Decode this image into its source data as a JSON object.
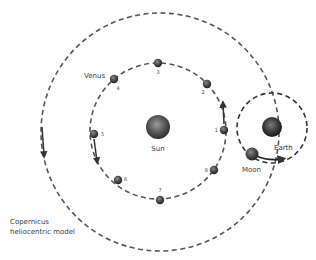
{
  "title": "Copernicus heliocentric model",
  "caption": {
    "line1": "Copernicus",
    "line2": "heliocentric model"
  },
  "labels": {
    "sun": "Sun",
    "venus": "Venus",
    "earth": "Earth",
    "moon": "Moon"
  },
  "venus_positions": [
    {
      "n": "1",
      "x": 224,
      "y": 130
    },
    {
      "n": "2",
      "x": 207,
      "y": 84
    },
    {
      "n": "3",
      "x": 158,
      "y": 63
    },
    {
      "n": "4",
      "x": 114,
      "y": 79
    },
    {
      "n": "5",
      "x": 94,
      "y": 134
    },
    {
      "n": "6",
      "x": 118,
      "y": 180
    },
    {
      "n": "7",
      "x": 160,
      "y": 200
    },
    {
      "n": "8",
      "x": 214,
      "y": 170
    }
  ],
  "orbits": {
    "earth_orbit": {
      "cx": 160,
      "cy": 132,
      "r": 119
    },
    "venus_orbit": {
      "cx": 158,
      "cy": 131,
      "r": 68
    },
    "moon_orbit": {
      "cx": 272,
      "cy": 128,
      "r": 35
    }
  },
  "colors": {
    "orbit_stroke": "#555555",
    "text": "#3a3a3a",
    "background": "#ffffff"
  }
}
